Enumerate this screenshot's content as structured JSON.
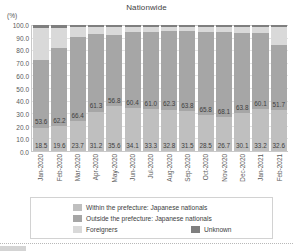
{
  "chart_data": {
    "type": "bar",
    "title": "Nationwide",
    "xlabel": "",
    "ylabel": "(%)",
    "ylim": [
      0.0,
      100.0
    ],
    "ytick_labels": [
      "100.0",
      "90.0",
      "80.0",
      "70.0",
      "60.0",
      "50.0",
      "40.0",
      "30.0",
      "20.0",
      "10.0",
      "0.0"
    ],
    "ytick_values": [
      100.0,
      90.0,
      80.0,
      70.0,
      60.0,
      50.0,
      40.0,
      30.0,
      20.0,
      10.0,
      0.0
    ],
    "grid": true,
    "stacked": true,
    "legend_position": "bottom",
    "categories": [
      "Jan-2020",
      "Feb-2020",
      "Mar-2020",
      "Apr-2020",
      "May-2020",
      "Jun-2020",
      "Jul-2020",
      "Aug-2020",
      "Sep-2020",
      "Oct-2020",
      "Nov-2020",
      "Dec-2020",
      "Jan-2021",
      "Feb-2021"
    ],
    "series": [
      {
        "name": "Within the prefecture: Japanese nationals",
        "color": "#bfbfbf",
        "values": [
          18.5,
          19.6,
          23.7,
          31.2,
          35.6,
          34.1,
          33.3,
          32.8,
          31.5,
          28.5,
          26.7,
          30.1,
          33.2,
          32.6
        ],
        "labels": [
          "18.5",
          "19.6",
          "23.7",
          "31.2",
          "35.6",
          "34.1",
          "33.3",
          "32.8",
          "31.5",
          "28.5",
          "26.7",
          "30.1",
          "33.2",
          "32.6"
        ]
      },
      {
        "name": "Outside the prefecture: Japanese nationals",
        "color": "#a6a6a6",
        "values": [
          53.6,
          62.2,
          66.4,
          61.3,
          56.8,
          60.4,
          61.0,
          62.3,
          63.8,
          65.8,
          68.1,
          63.8,
          60.1,
          51.7
        ],
        "labels": [
          "53.6",
          "62.2",
          "66.4",
          "61.3",
          "56.8",
          "60.4",
          "61.0",
          "62.3",
          "63.8",
          "65.8",
          "68.1",
          "63.8",
          "60.1",
          "51.7"
        ]
      },
      {
        "name": "Foreigners",
        "color": "#d9d9d9",
        "values": [
          25.6,
          16.0,
          8.0,
          6.0,
          6.1,
          4.0,
          4.3,
          3.5,
          3.3,
          4.3,
          3.8,
          4.7,
          5.3,
          14.0
        ],
        "labels": [
          "",
          "",
          "",
          "",
          "",
          "",
          "",
          "",
          "",
          "",
          "",
          "",
          "",
          ""
        ]
      },
      {
        "name": "Unknown",
        "color": "#7f7f7f",
        "values": [
          2.3,
          2.2,
          1.9,
          1.5,
          1.5,
          1.5,
          1.4,
          1.4,
          1.4,
          1.4,
          1.4,
          1.4,
          1.4,
          1.7
        ],
        "labels": [
          "",
          "",
          "",
          "",
          "",
          "",
          "",
          "",
          "",
          "",
          "",
          "",
          "",
          ""
        ]
      }
    ]
  },
  "legend": {
    "entries": [
      {
        "label": "Within the prefecture: Japanese nationals",
        "color": "#bfbfbf"
      },
      {
        "label": "Outside the prefecture: Japanese nationals",
        "color": "#a6a6a6"
      },
      {
        "label": "Foreigners",
        "color": "#d9d9d9"
      },
      {
        "label": "Unknown",
        "color": "#7f7f7f"
      }
    ]
  }
}
